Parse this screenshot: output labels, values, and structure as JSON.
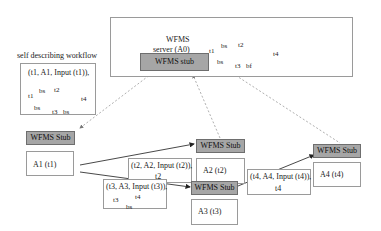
{
  "server": {
    "title_line1": "WFMS",
    "title_line2": "server (A0)",
    "stub_label": "WFMS stub",
    "mini_flow": {
      "n1": "t1",
      "n2": "t2",
      "n3": "t3",
      "n4": "t4",
      "e12": "bs",
      "e13": "bs",
      "e34": "bf"
    }
  },
  "self_describing": {
    "title": "self describing workflow",
    "tuple": "(t1, A1, Input (t1)),",
    "mini_flow": {
      "n1": "t1",
      "n2": "t2",
      "n3": "t3",
      "n4": "t4",
      "e12": "bs",
      "e13": "bs",
      "e34": "bs"
    }
  },
  "nodes": [
    {
      "id": "A1",
      "stub_label": "WFMS Stub",
      "label": "A1 (t1)"
    },
    {
      "id": "A2",
      "stub_label": "WFMS Stub",
      "label": "A2 (t2)"
    },
    {
      "id": "A3",
      "stub_label": "WFMS Stub",
      "label": "A3 (t3)"
    },
    {
      "id": "A4",
      "stub_label": "WFMS Stub",
      "label": "A4 (t4)"
    }
  ],
  "messages": [
    {
      "to": "A2",
      "line1": "(t2, A2, Input  (t2)),",
      "line2": "t2"
    },
    {
      "to": "A3",
      "line1": "(t3, A3, Input (t3)),",
      "flow_from": "t3",
      "flow_to": "t4",
      "flow_edge": "bs"
    },
    {
      "to": "A4",
      "line1": "(t4, A4, Input (t4)),",
      "line2": "t4"
    }
  ],
  "colors": {
    "stub_fill": "#a6a6a6",
    "box_border": "#9a9a9a",
    "dashed_line": "#9a9a9a",
    "solid_arrow": "#333333"
  }
}
